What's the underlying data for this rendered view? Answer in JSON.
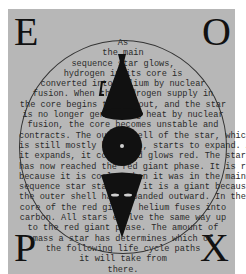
{
  "card": {
    "corners": {
      "top_left": "E",
      "top_right": "O",
      "bottom_left": "P",
      "bottom_right": "X"
    },
    "text_lines": [
      "As",
      "the main",
      "sequence star glows,",
      "hydrogen in its core is",
      "converted into helium by nuclear",
      "fusion. When the hydrogen supply in",
      "the core begins to run out, and the star",
      "is no longer generating heat by nuclear",
      "fusion, the core becomes unstable and",
      "contracts. The outer shell of the star, which",
      "is still mostly hydrogen, starts to expand. As",
      "it expands, it cools and glows red. The star",
      "has now reached the red giant phase. It is red",
      "because it is cooler than it was in the main",
      "sequence star stage and it is a giant because",
      "the outer shell has expanded outward. In the",
      "core of the red giant, helium fuses into",
      "carbon. All stars evolve the same way up",
      "to the red giant phase. The amount of",
      "mass a star has determines which of",
      "the following life cycle paths",
      "it will take from",
      "there."
    ],
    "figures": [
      "megaphone-icon",
      "disc-icon",
      "cone-face-icon"
    ],
    "colors": {
      "card_bg": "#b7b7b7",
      "ink": "#111111",
      "page_bg": "#ffffff"
    }
  }
}
